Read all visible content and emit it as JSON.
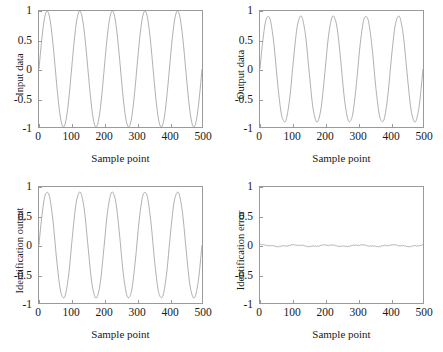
{
  "figure": {
    "background": "#ffffff",
    "line_color": "#8c8c8c",
    "axis_color": "#9a9a9a",
    "text_color": "#1a1a1a"
  },
  "panels": [
    {
      "key": "input",
      "ylabel": "Input data",
      "xlabel": "Sample point"
    },
    {
      "key": "output",
      "ylabel": "Output data",
      "xlabel": "Sample point"
    },
    {
      "key": "identout",
      "ylabel": "Identification output",
      "xlabel": "Sample point"
    },
    {
      "key": "identerr",
      "ylabel": "Identification error",
      "xlabel": "Sample point"
    }
  ],
  "ticks": {
    "x": [
      "0",
      "100",
      "200",
      "300",
      "400",
      "500"
    ],
    "y": [
      "1",
      "0.5",
      "0",
      "-0.5",
      "-1"
    ]
  },
  "chart_data": [
    {
      "type": "line",
      "id": "input-data",
      "title": "",
      "xlabel": "Sample point",
      "ylabel": "Input data",
      "xlim": [
        0,
        500
      ],
      "ylim": [
        -1,
        1
      ],
      "xticks": [
        0,
        100,
        200,
        300,
        400,
        500
      ],
      "yticks": [
        -1,
        -0.5,
        0,
        0.5,
        1
      ],
      "grid": false,
      "legend": null,
      "description": "Sinusoidal input signal, amplitude 1, period 100 samples, 5 full cycles over 500 points, phase such that peak occurs near sample 25.",
      "generator": {
        "formula": "sin(2*pi*n/100)",
        "amplitude": 1.0,
        "period": 100,
        "phase": 0,
        "n_points": 500
      },
      "series": [
        {
          "name": "input",
          "x": [
            0,
            25,
            50,
            75,
            100,
            125,
            150,
            175,
            200,
            225,
            250,
            275,
            300,
            325,
            350,
            375,
            400,
            425,
            450,
            475,
            500
          ],
          "values": [
            0,
            1,
            0,
            -1,
            0,
            1,
            0,
            -1,
            0,
            1,
            0,
            -1,
            0,
            1,
            0,
            -1,
            0,
            1,
            0,
            -1,
            0
          ]
        }
      ]
    },
    {
      "type": "line",
      "id": "output-data",
      "title": "",
      "xlabel": "Sample point",
      "ylabel": "Output data",
      "xlim": [
        0,
        500
      ],
      "ylim": [
        -1,
        1
      ],
      "xticks": [
        0,
        100,
        200,
        300,
        400,
        500
      ],
      "yticks": [
        -1,
        -0.5,
        0,
        0.5,
        1
      ],
      "grid": false,
      "legend": null,
      "description": "Plant output: sinusoid of amplitude ~0.97 with slight nonlinear flattening near the peaks, period 100 samples, 5 cycles.",
      "generator": {
        "formula": "~sin(2*pi*n/100) with mild saturation",
        "amplitude": 0.97,
        "period": 100,
        "phase": 0,
        "n_points": 500
      },
      "series": [
        {
          "name": "output",
          "x": [
            0,
            25,
            50,
            75,
            100,
            125,
            150,
            175,
            200,
            225,
            250,
            275,
            300,
            325,
            350,
            375,
            400,
            425,
            450,
            475,
            500
          ],
          "values": [
            0,
            0.97,
            0,
            -0.98,
            0,
            0.97,
            0,
            -0.98,
            0,
            0.97,
            0,
            -0.98,
            0,
            0.97,
            0,
            -0.98,
            0,
            0.97,
            0,
            -0.98,
            0
          ]
        }
      ]
    },
    {
      "type": "line",
      "id": "identification-output",
      "title": "",
      "xlabel": "Sample point",
      "ylabel": "Identification output",
      "xlim": [
        0,
        500
      ],
      "ylim": [
        -1,
        1
      ],
      "xticks": [
        0,
        100,
        200,
        300,
        400,
        500
      ],
      "yticks": [
        -1,
        -0.5,
        0,
        0.5,
        1
      ],
      "grid": false,
      "legend": null,
      "description": "Identified model output, visually overlapping the plant output: amplitude ~0.97, period 100 samples, 5 cycles.",
      "generator": {
        "formula": "~sin(2*pi*n/100) with mild saturation",
        "amplitude": 0.97,
        "period": 100,
        "phase": 0,
        "n_points": 500
      },
      "series": [
        {
          "name": "identification output",
          "x": [
            0,
            25,
            50,
            75,
            100,
            125,
            150,
            175,
            200,
            225,
            250,
            275,
            300,
            325,
            350,
            375,
            400,
            425,
            450,
            475,
            500
          ],
          "values": [
            0,
            0.97,
            0,
            -0.98,
            0,
            0.97,
            0,
            -0.98,
            0,
            0.97,
            0,
            -0.98,
            0,
            0.97,
            0,
            -0.98,
            0,
            0.97,
            0,
            -0.98,
            0
          ]
        }
      ]
    },
    {
      "type": "line",
      "id": "identification-error",
      "title": "",
      "xlabel": "Sample point",
      "ylabel": "Identification error",
      "xlim": [
        0,
        500
      ],
      "ylim": [
        -1,
        1
      ],
      "xticks": [
        0,
        100,
        200,
        300,
        400,
        500
      ],
      "yticks": [
        -1,
        -0.5,
        0,
        0.5,
        1
      ],
      "grid": false,
      "legend": null,
      "description": "Identification error, essentially flat at zero with small ripples of magnitude under 0.03 across the full 500-sample record.",
      "generator": {
        "formula": "output - identification output",
        "amplitude": 0.02,
        "period": 100,
        "phase": 0,
        "n_points": 500
      },
      "series": [
        {
          "name": "identification error",
          "x": [
            0,
            25,
            50,
            75,
            100,
            125,
            150,
            175,
            200,
            225,
            250,
            275,
            300,
            325,
            350,
            375,
            400,
            425,
            450,
            475,
            500
          ],
          "values": [
            -0.01,
            -0.02,
            -0.01,
            0.01,
            -0.01,
            -0.02,
            -0.01,
            0.01,
            -0.01,
            -0.02,
            -0.01,
            0.01,
            -0.01,
            -0.02,
            -0.01,
            0.01,
            -0.01,
            -0.02,
            -0.01,
            0.01,
            -0.01
          ]
        }
      ]
    }
  ]
}
